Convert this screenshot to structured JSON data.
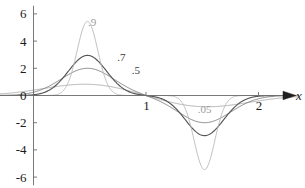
{
  "chart_data": {
    "type": "line",
    "title": "",
    "xlabel": "x",
    "ylabel": "",
    "xlim": [
      -0.3,
      2.35
    ],
    "ylim": [
      -6.6,
      6.6
    ],
    "grid": false,
    "legend_position": "inline-annotations",
    "x_ticks": [
      {
        "value": 1,
        "label": "1"
      },
      {
        "value": 2,
        "label": "2"
      }
    ],
    "y_ticks": [
      {
        "value": 6,
        "label": "6"
      },
      {
        "value": 4,
        "label": "4"
      },
      {
        "value": 2,
        "label": "2"
      },
      {
        "value": 0,
        "label": "0"
      },
      {
        "value": -2,
        "label": "-2"
      },
      {
        "value": -4,
        "label": "-4"
      },
      {
        "value": -6,
        "label": "-6"
      }
    ],
    "annotations": [
      {
        "text": ".9",
        "x": 0.52,
        "y": 5.1,
        "series": "0.9"
      },
      {
        "text": ".7",
        "x": 0.78,
        "y": 2.55,
        "series": "0.7"
      },
      {
        "text": ".5",
        "x": 0.91,
        "y": 1.55,
        "series": "0.5"
      },
      {
        "text": ".05",
        "x": 1.52,
        "y": -1.3,
        "series": "0.05"
      }
    ],
    "series": [
      {
        "name": "0.9",
        "color": "#b9b9b9",
        "peak_x": 0.48,
        "peak_y": 5.45,
        "trough_x": 1.52,
        "trough_y": -5.45,
        "width": 0.13
      },
      {
        "name": "0.7",
        "color": "#555555",
        "peak_x": 0.48,
        "peak_y": 2.95,
        "trough_x": 1.52,
        "trough_y": -2.95,
        "width": 0.24
      },
      {
        "name": "0.5",
        "color": "#777777",
        "peak_x": 0.48,
        "peak_y": 2.0,
        "trough_x": 1.52,
        "trough_y": -2.0,
        "width": 0.33
      },
      {
        "name": "0.05",
        "color": "#a8a8a8",
        "peak_x": 0.48,
        "peak_y": 0.85,
        "trough_x": 1.52,
        "trough_y": -0.85,
        "width": 0.55
      }
    ],
    "axis_x_label": "x"
  },
  "figure": {
    "caption": ""
  }
}
